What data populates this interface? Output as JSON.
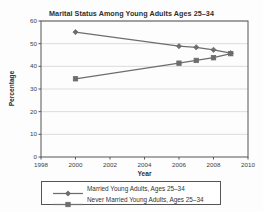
{
  "chart_data": {
    "type": "line",
    "title": "Marital Status Among Young Adults Ages 25–34",
    "xlabel": "Year",
    "ylabel": "Percentage",
    "xlim": [
      1998,
      2010
    ],
    "ylim": [
      0,
      60
    ],
    "xticks": [
      1998,
      2000,
      2002,
      2004,
      2006,
      2008,
      2010
    ],
    "yticks": [
      0,
      10,
      20,
      30,
      40,
      50,
      60
    ],
    "grid": "horizontal",
    "legend_position": "below-axes",
    "series": [
      {
        "name": "Married Young Adults, Ages 25–34",
        "marker": "diamond",
        "color": "#6d6d6d",
        "x": [
          2000,
          2006,
          2007,
          2008,
          2009
        ],
        "values": [
          55.1,
          48.9,
          48.4,
          47.3,
          45.8
        ]
      },
      {
        "name": "Never Married Young Adults, Ages 25–34",
        "marker": "square",
        "color": "#6d6d6d",
        "x": [
          2000,
          2006,
          2007,
          2008,
          2009
        ],
        "values": [
          34.5,
          41.4,
          42.6,
          43.8,
          45.6
        ]
      }
    ]
  },
  "axis": {
    "ylabel": "Percentage",
    "xlabel": "Year",
    "ytick_labels": [
      "60",
      "50",
      "40",
      "30",
      "20",
      "10",
      "0"
    ],
    "xtick_labels": [
      "1998",
      "2000",
      "2002",
      "2004",
      "2006",
      "2008",
      "2010"
    ]
  },
  "legend": {
    "items": [
      {
        "label": "Married Young Adults, Ages 25–34",
        "marker": "diamond"
      },
      {
        "label": "Never Married Young Adults, Ages 25–34",
        "marker": "square"
      }
    ]
  },
  "colors": {
    "series": "#6d6d6d",
    "axis": "#555555",
    "grid": "#cfcfcf",
    "text": "#333333",
    "background": "#fdfdfd"
  }
}
